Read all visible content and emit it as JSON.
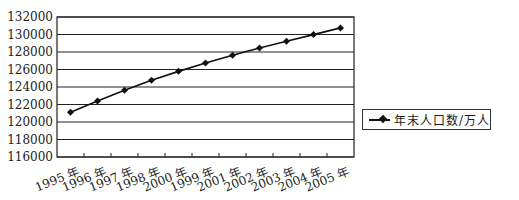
{
  "chart_data": {
    "type": "line",
    "title": "",
    "xlabel": "",
    "ylabel": "",
    "categories": [
      "1995 年",
      "1996 年",
      "1997 年",
      "1998 年",
      "2000 年",
      "1999 年",
      "2001 年",
      "2002 年",
      "2003 年",
      "2004 年",
      "2005 年"
    ],
    "series": [
      {
        "name": "年末人口数/万人",
        "values": [
          121121,
          122389,
          123626,
          124761,
          125786,
          126743,
          127627,
          128453,
          129227,
          129988,
          130756
        ],
        "color": "#111111",
        "marker": "diamond"
      }
    ],
    "ylim": [
      116000,
      132000
    ],
    "yticks": [
      116000,
      118000,
      120000,
      122000,
      124000,
      126000,
      128000,
      130000,
      132000
    ],
    "grid": true,
    "legend_position": "right"
  },
  "legend": {
    "label": "年末人口数/万人"
  }
}
